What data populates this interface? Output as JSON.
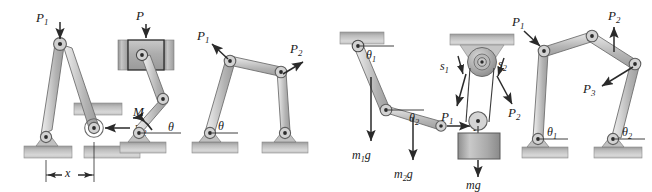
{
  "figure": {
    "panel_count": 6,
    "width": 652,
    "height": 192,
    "background_color": "#ffffff",
    "ink_color": "#1a1a1a",
    "link_fill": "#bdbdbd",
    "link_fill_light": "#d4d4d4",
    "ground_fill": "#b5b5b5",
    "pulley_fill": "#a8a8a8"
  },
  "panels": [
    {
      "id": "panel-1",
      "name": "two-bar-toggle-linkage",
      "description": "Symmetric two-bar toggle mechanism, left pin on ground, right pin on roller/slider, vertical load at apex.",
      "labels": [
        {
          "key": "P1",
          "base": "P",
          "sub": "1",
          "x": 44,
          "y": 41,
          "role": "applied-force",
          "direction": "down"
        },
        {
          "key": "P2",
          "base": "P",
          "sub": "2",
          "x": 140,
          "y": 136,
          "role": "applied-force",
          "direction": "left"
        },
        {
          "key": "x",
          "base": "x",
          "sub": "",
          "x": 58,
          "y": 172,
          "role": "dimension",
          "direction": "horizontal"
        }
      ]
    },
    {
      "id": "panel-2",
      "name": "slider-crank-with-moment",
      "description": "Slider-crank: vertical force P on the slider block in guides, coupler to crank, moment M applied at ground pin, crank angle theta.",
      "labels": [
        {
          "key": "P",
          "base": "P",
          "sub": "",
          "x": 140,
          "y": 20,
          "role": "applied-force",
          "direction": "down"
        },
        {
          "key": "M",
          "base": "M",
          "sub": "",
          "x": 140,
          "y": 118,
          "role": "applied-moment",
          "direction": "ccw"
        },
        {
          "key": "theta",
          "base": "θ",
          "sub": "",
          "x": 176,
          "y": 139,
          "role": "angle",
          "direction": "from-horizontal"
        }
      ]
    },
    {
      "id": "panel-3",
      "name": "four-bar-linkage",
      "description": "Four-bar linkage on two ground pins, force P1 up-left at left upper joint, force P2 up-right at right upper joint, angle theta at left ground pin.",
      "labels": [
        {
          "key": "P1",
          "base": "P",
          "sub": "1",
          "x": 204,
          "y": 41,
          "role": "applied-force",
          "direction": "up-left"
        },
        {
          "key": "P2",
          "base": "P",
          "sub": "2",
          "x": 296,
          "y": 62,
          "role": "applied-force",
          "direction": "up-right"
        },
        {
          "key": "theta",
          "base": "θ",
          "sub": "",
          "x": 217,
          "y": 140,
          "role": "angle",
          "direction": "from-horizontal"
        }
      ]
    },
    {
      "id": "panel-4",
      "name": "double-pendulum-two-link",
      "description": "Two-link pendulum hanging from ceiling; link weights m1 g and m2 g act downward at mid-links; horizontal force P at the free end; link angles theta1 and theta2 from horizontal.",
      "labels": [
        {
          "key": "theta1",
          "base": "θ",
          "sub": "1",
          "x": 371,
          "y": 48,
          "role": "angle",
          "direction": "from-horizontal"
        },
        {
          "key": "theta2",
          "base": "θ",
          "sub": "2",
          "x": 413,
          "y": 117,
          "role": "angle",
          "direction": "from-horizontal"
        },
        {
          "key": "m1g",
          "base": "m",
          "sub": "1",
          "suffix": "g",
          "x": 341,
          "y": 160,
          "role": "weight",
          "direction": "down"
        },
        {
          "key": "m2g",
          "base": "m",
          "sub": "2",
          "suffix": "g",
          "x": 384,
          "y": 180,
          "role": "weight",
          "direction": "down"
        },
        {
          "key": "P",
          "base": "P",
          "sub": "",
          "x": 451,
          "y": 134,
          "role": "applied-force",
          "direction": "right"
        }
      ]
    },
    {
      "id": "panel-5",
      "name": "pulley-block-system",
      "description": "Fixed double pulley on ceiling with two cords; cord displacements s1 and s2 with tensions P1 and P2; movable pulley carries a block of weight mg.",
      "labels": [
        {
          "key": "s1",
          "base": "s",
          "sub": "1",
          "x": 443,
          "y": 67,
          "role": "displacement",
          "direction": "down-left"
        },
        {
          "key": "s2",
          "base": "s",
          "sub": "2",
          "x": 496,
          "y": 66,
          "role": "displacement",
          "direction": "down-right"
        },
        {
          "key": "P1",
          "base": "P",
          "sub": "1",
          "x": 445,
          "y": 117,
          "role": "applied-force",
          "direction": "down-left"
        },
        {
          "key": "P2",
          "base": "P",
          "sub": "2",
          "x": 510,
          "y": 113,
          "role": "applied-force",
          "direction": "down-right"
        },
        {
          "key": "mg",
          "base": "m",
          "sub": "",
          "suffix": "g",
          "x": 470,
          "y": 182,
          "role": "weight",
          "direction": "down"
        }
      ]
    },
    {
      "id": "panel-6",
      "name": "five-bar-linkage",
      "description": "Five-bar (two ground pins) linkage; P1 pushes down-right onto left upper joint, P2 points up at top joint, P3 points down-left at right elbow; ground angles theta1 and theta2.",
      "labels": [
        {
          "key": "P1",
          "base": "P",
          "sub": "1",
          "x": 523,
          "y": 20,
          "role": "applied-force",
          "direction": "down-right"
        },
        {
          "key": "P2",
          "base": "P",
          "sub": "2",
          "x": 615,
          "y": 16,
          "role": "applied-force",
          "direction": "up"
        },
        {
          "key": "P3",
          "base": "P",
          "sub": "3",
          "x": 588,
          "y": 119,
          "role": "applied-force",
          "direction": "down-left"
        },
        {
          "key": "theta1",
          "base": "θ",
          "sub": "1",
          "x": 547,
          "y": 137,
          "role": "angle",
          "direction": "from-horizontal"
        },
        {
          "key": "theta2",
          "base": "θ",
          "sub": "2",
          "x": 622,
          "y": 135,
          "role": "angle",
          "direction": "from-horizontal"
        }
      ]
    }
  ]
}
